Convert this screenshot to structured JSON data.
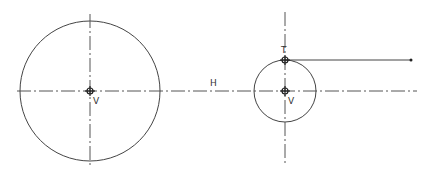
{
  "diagram": {
    "colors": {
      "line": "#444444",
      "background": "#ffffff"
    },
    "labels": {
      "left_center": "V",
      "horizontal_axis": "H",
      "right_top_point": "T",
      "right_center": "V"
    },
    "horizontal_centerline": {
      "y": 91,
      "x1": 17,
      "x2": 417
    },
    "left_circle": {
      "cx": 90,
      "cy": 91,
      "r": 70,
      "axis_y1": 14,
      "axis_y2": 166
    },
    "right_circle": {
      "cx": 285,
      "cy": 91,
      "r": 31,
      "axis_y1": 12,
      "axis_y2": 166
    },
    "tangent_line": {
      "x1": 285,
      "y1": 60,
      "x2": 411,
      "y2": 60
    }
  }
}
